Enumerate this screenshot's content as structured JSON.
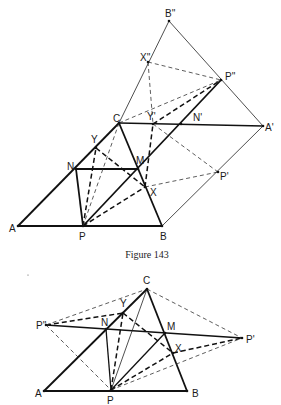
{
  "figure_top": {
    "caption": "Figure 143",
    "points": {
      "A": {
        "label": "A",
        "x": 18,
        "y": 226,
        "lx": 9,
        "ly": 232
      },
      "P": {
        "label": "P",
        "x": 83,
        "y": 226,
        "lx": 79,
        "ly": 240
      },
      "B": {
        "label": "B",
        "x": 162,
        "y": 226,
        "lx": 160,
        "ly": 240
      },
      "C": {
        "label": "C",
        "x": 119,
        "y": 123,
        "lx": 113,
        "ly": 122
      },
      "N": {
        "label": "N",
        "x": 76,
        "y": 169,
        "lx": 67,
        "ly": 170
      },
      "M": {
        "label": "M",
        "x": 138,
        "y": 169,
        "lx": 136,
        "ly": 164
      },
      "Y": {
        "label": "Y",
        "x": 96,
        "y": 148,
        "lx": 91,
        "ly": 143
      },
      "X": {
        "label": "X",
        "x": 145,
        "y": 187,
        "lx": 150,
        "ly": 196
      },
      "Yp": {
        "label": "Y'",
        "x": 153,
        "y": 124,
        "lx": 147,
        "ly": 120
      },
      "Np": {
        "label": "N'",
        "x": 181,
        "y": 124,
        "lx": 193,
        "ly": 121
      },
      "Ap": {
        "label": "A'",
        "x": 263,
        "y": 126,
        "lx": 265,
        "ly": 131
      },
      "Pp": {
        "label": "P'",
        "x": 218,
        "y": 172,
        "lx": 220,
        "ly": 180
      },
      "Ppp": {
        "label": "P''",
        "x": 221,
        "y": 80,
        "lx": 225,
        "ly": 80
      },
      "Xpp": {
        "label": "X''",
        "x": 148,
        "y": 62,
        "lx": 140,
        "ly": 61
      },
      "Bpp": {
        "label": "B''",
        "x": 169,
        "y": 21,
        "lx": 165,
        "ly": 17
      }
    },
    "segments": [
      {
        "from": "A",
        "to": "B",
        "style": "thick"
      },
      {
        "from": "A",
        "to": "C",
        "style": "thick"
      },
      {
        "from": "C",
        "to": "B",
        "style": "thick"
      },
      {
        "from": "N",
        "to": "M",
        "style": "thick"
      },
      {
        "from": "N",
        "to": "P",
        "style": "thick"
      },
      {
        "from": "P",
        "to": "Ppp",
        "style": "thick"
      },
      {
        "from": "C",
        "to": "Ap",
        "style": "med"
      },
      {
        "from": "C",
        "to": "Bpp",
        "style": "thin"
      },
      {
        "from": "Bpp",
        "to": "Ap",
        "style": "thin"
      },
      {
        "from": "B",
        "to": "Ap",
        "style": "thin"
      },
      {
        "from": "P",
        "to": "Y",
        "style": "dthick"
      },
      {
        "from": "Y",
        "to": "X",
        "style": "dthick"
      },
      {
        "from": "P",
        "to": "X",
        "style": "dthick"
      },
      {
        "from": "X",
        "to": "Yp",
        "style": "dthick"
      },
      {
        "from": "Yp",
        "to": "Ppp",
        "style": "dthick"
      },
      {
        "from": "P",
        "to": "C",
        "style": "dthin"
      },
      {
        "from": "C",
        "to": "Ppp",
        "style": "dthin"
      },
      {
        "from": "Xpp",
        "to": "Ppp",
        "style": "dthin"
      },
      {
        "from": "Xpp",
        "to": "Yp",
        "style": "dthin"
      },
      {
        "from": "X",
        "to": "Pp",
        "style": "dthin"
      },
      {
        "from": "Yp",
        "to": "Pp",
        "style": "dthin"
      }
    ]
  },
  "figure_bottom": {
    "points": {
      "A": {
        "label": "A",
        "x": 44,
        "y": 391,
        "lx": 35,
        "ly": 397
      },
      "P": {
        "label": "P",
        "x": 111,
        "y": 390,
        "lx": 107,
        "ly": 404
      },
      "B": {
        "label": "B",
        "x": 187,
        "y": 391,
        "lx": 192,
        "ly": 397
      },
      "C": {
        "label": "C",
        "x": 147,
        "y": 289,
        "lx": 143,
        "ly": 284
      },
      "N": {
        "label": "N",
        "x": 106,
        "y": 329,
        "lx": 101,
        "ly": 326
      },
      "M": {
        "label": "M",
        "x": 165,
        "y": 333,
        "lx": 167,
        "ly": 330
      },
      "Y": {
        "label": "Y",
        "x": 123,
        "y": 313,
        "lx": 120,
        "ly": 307
      },
      "X": {
        "label": "X",
        "x": 173,
        "y": 353,
        "lx": 175,
        "ly": 352
      },
      "Pp": {
        "label": "P'",
        "x": 242,
        "y": 338,
        "lx": 246,
        "ly": 343
      },
      "Ppp": {
        "label": "P''",
        "x": 46,
        "y": 325,
        "lx": 36,
        "ly": 329
      }
    },
    "segments": [
      {
        "from": "A",
        "to": "B",
        "style": "thick"
      },
      {
        "from": "A",
        "to": "C",
        "style": "thick"
      },
      {
        "from": "C",
        "to": "B",
        "style": "thick"
      },
      {
        "from": "Ppp",
        "to": "Pp",
        "style": "med"
      },
      {
        "from": "N",
        "to": "P",
        "style": "med"
      },
      {
        "from": "P",
        "to": "M",
        "style": "med"
      },
      {
        "from": "P",
        "to": "C",
        "style": "thin"
      },
      {
        "from": "P",
        "to": "Y",
        "style": "dthick"
      },
      {
        "from": "Y",
        "to": "X",
        "style": "dthick"
      },
      {
        "from": "P",
        "to": "X",
        "style": "dthick"
      },
      {
        "from": "Ppp",
        "to": "Y",
        "style": "dthick"
      },
      {
        "from": "X",
        "to": "Pp",
        "style": "dthick"
      },
      {
        "from": "Ppp",
        "to": "C",
        "style": "dthin"
      },
      {
        "from": "C",
        "to": "Pp",
        "style": "dthin"
      },
      {
        "from": "Ppp",
        "to": "P",
        "style": "dthin"
      },
      {
        "from": "P",
        "to": "Pp",
        "style": "dthin"
      }
    ]
  }
}
